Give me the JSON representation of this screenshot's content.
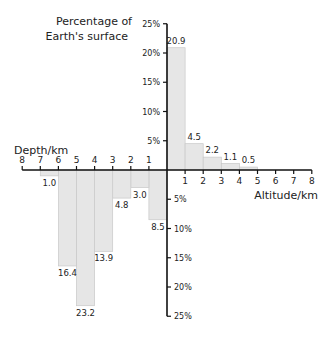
{
  "chart_data": {
    "type": "bar",
    "title": "",
    "ylabel": "Percentage of Earth's surface",
    "xlabel_left": "Depth/km",
    "xlabel_right": "Altitude/km",
    "x_ticks_left": [
      "8",
      "7",
      "6",
      "5",
      "4",
      "3",
      "2",
      "1"
    ],
    "x_ticks_right": [
      "1",
      "2",
      "3",
      "4",
      "5",
      "6",
      "7",
      "8"
    ],
    "y_ticks_up": [
      "5%",
      "10%",
      "15%",
      "20%",
      "25%"
    ],
    "y_ticks_down": [
      "5%",
      "10%",
      "15%",
      "20%",
      "25%"
    ],
    "ylim": [
      -25,
      25
    ],
    "xlim": [
      -8,
      8
    ],
    "grid": false,
    "bar_color": "#e6e6e6",
    "bar_edge_color": "#c8c8c8",
    "altitude": {
      "categories": [
        "0-1",
        "1-2",
        "2-3",
        "3-4",
        "4-5"
      ],
      "values": [
        20.9,
        4.5,
        2.2,
        1.1,
        0.5
      ],
      "labels": [
        "20.9",
        "4.5",
        "2.2",
        "1.1",
        "0.5"
      ]
    },
    "depth": {
      "categories": [
        "0-1",
        "1-2",
        "2-3",
        "3-4",
        "4-5",
        "5-6",
        "6-7"
      ],
      "values": [
        8.5,
        3.0,
        4.8,
        13.9,
        23.2,
        16.4,
        1.0
      ],
      "labels": [
        "8.5",
        "3.0",
        "4.8",
        "13.9",
        "23.2",
        "16.4",
        "1.0"
      ]
    }
  }
}
